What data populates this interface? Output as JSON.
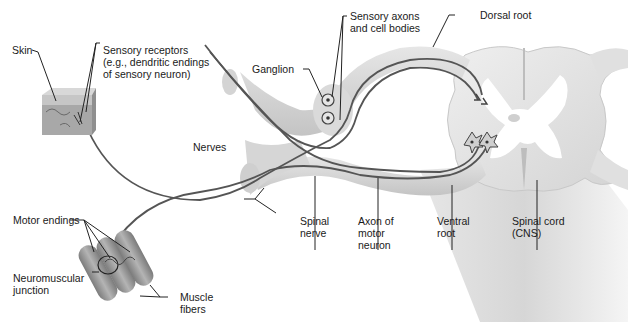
{
  "diagram": {
    "type": "anatomical-illustration",
    "colors": {
      "background": "#ffffff",
      "tissue": "#d9d9d9",
      "tissue_light": "#ececec",
      "axon": "#555555",
      "leader_line": "#222222",
      "muscle": "#9a9a9a",
      "skin": "#b5b5b5"
    },
    "labels": {
      "skin": "Skin",
      "sensory_receptors": "Sensory receptors\n(e.g., dendritic endings\nof sensory neuron)",
      "ganglion": "Ganglion",
      "sensory_axons": "Sensory axons\nand cell bodies",
      "dorsal_root": "Dorsal root",
      "nerves": "Nerves",
      "spinal_nerve": "Spinal\nnerve",
      "axon_motor": "Axon of\nmotor\nneuron",
      "ventral_root": "Ventral\nroot",
      "spinal_cord": "Spinal cord\n(CNS)",
      "motor_endings": "Motor endings",
      "neuromuscular_junction": "Neuromuscular\njunction",
      "muscle_fibers": "Muscle\nfibers"
    }
  }
}
